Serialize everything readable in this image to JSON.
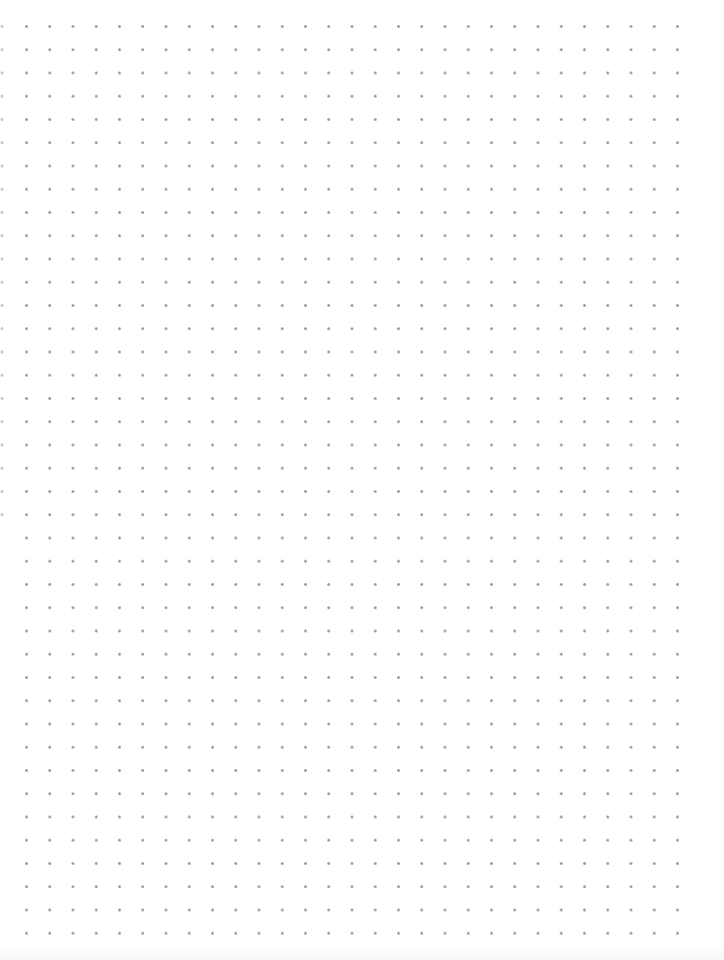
{
  "page": {
    "type": "dot-grid-paper",
    "background_color": "#ffffff",
    "dot_color": "#9a9a9a"
  },
  "grid": {
    "columns": 29,
    "rows": 40,
    "spacing_px": 23.25,
    "first_dot": {
      "x": 26,
      "y": 26
    },
    "last_dot": {
      "x": 677,
      "y": 932
    }
  },
  "edge_column": {
    "x": 2,
    "visible_rows": 22
  }
}
